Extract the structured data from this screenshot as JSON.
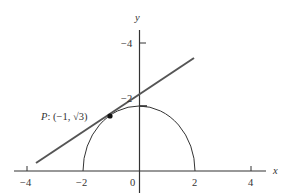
{
  "diagram": {
    "type": "coordinate-plot",
    "axes": {
      "x_label": "x",
      "y_label": "y",
      "x_ticks": [
        "−4",
        "−2",
        "0",
        "2",
        "4"
      ],
      "y_ticks": [
        "−4",
        "−2"
      ]
    },
    "curves": [
      {
        "name": "upper semicircle",
        "equation": "x^2 + y^2 = 4, y ≥ 0"
      },
      {
        "name": "tangent line at P"
      }
    ],
    "point": {
      "label_prefix": "P",
      "label": "P: (−1, √3)",
      "x": -1,
      "y": "√3"
    },
    "colors": {
      "axes": "#333333",
      "tangent_line": "#555555",
      "curve": "#333333",
      "point": "#111111"
    }
  }
}
